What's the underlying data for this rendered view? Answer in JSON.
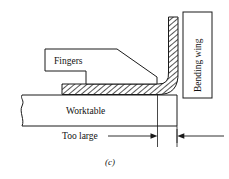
{
  "figure": {
    "caption": "(c)",
    "type": "technical-diagram",
    "background_color": "#ffffff",
    "line_color": "#1a1a1a"
  },
  "labels": {
    "fingers": "Fingers",
    "worktable": "Worktable",
    "bending_wing": "Bending wing",
    "too_large": "Too large"
  },
  "parts": [
    {
      "id": "fingers",
      "label": "Fingers",
      "description": "Clamping fingers with tapered nose"
    },
    {
      "id": "worktable",
      "label": "Worktable",
      "description": "Lower fixed table with break line at left"
    },
    {
      "id": "bending-wing",
      "label": "Bending wing",
      "description": "Rotating wing shown vertical"
    },
    {
      "id": "sheet",
      "label": "",
      "description": "Hatched sheet metal blank bent 90 degrees"
    }
  ],
  "dimension": {
    "label": "Too large",
    "note": "Distance from worktable edge to bend line is too large"
  }
}
